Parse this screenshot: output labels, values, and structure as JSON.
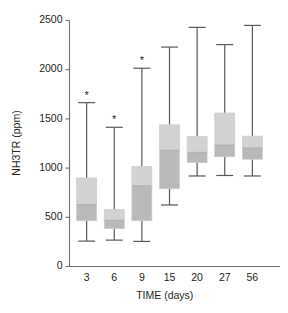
{
  "chart_data": {
    "type": "box",
    "title": "",
    "xlabel": "TIME (days)",
    "ylabel": "NH3TR (ppm)",
    "categories": [
      "3",
      "6",
      "9",
      "15",
      "20",
      "27",
      "56"
    ],
    "ylim": [
      0,
      2500
    ],
    "yticks": [
      0,
      500,
      1000,
      1500,
      2000,
      2500
    ],
    "ytick_labels": [
      "0",
      "500",
      "1000",
      "1500",
      "2000",
      "2500"
    ],
    "grid": false,
    "legend": "none",
    "colors": {
      "box_upper": "#d2d2d2",
      "box_lower": "#b9b9b9",
      "whisker": "#58595b",
      "axis": "#6d6e71",
      "text": "#231f20"
    },
    "boxes": [
      {
        "category": "3",
        "whisker_low": 258,
        "q1": 465,
        "median": 630,
        "q3": 900,
        "whisker_high": 1665,
        "outlier_marker": "*"
      },
      {
        "category": "6",
        "whisker_low": 268,
        "q1": 385,
        "median": 470,
        "q3": 580,
        "whisker_high": 1415,
        "outlier_marker": "*"
      },
      {
        "category": "9",
        "whisker_low": 255,
        "q1": 465,
        "median": 820,
        "q3": 1015,
        "whisker_high": 2015,
        "outlier_marker": "*"
      },
      {
        "category": "15",
        "whisker_low": 625,
        "q1": 790,
        "median": 1180,
        "q3": 1440,
        "whisker_high": 2230,
        "outlier_marker": ""
      },
      {
        "category": "20",
        "whisker_low": 920,
        "q1": 1055,
        "median": 1160,
        "q3": 1320,
        "whisker_high": 2430,
        "outlier_marker": ""
      },
      {
        "category": "27",
        "whisker_low": 925,
        "q1": 1115,
        "median": 1235,
        "q3": 1560,
        "whisker_high": 2255,
        "outlier_marker": ""
      },
      {
        "category": "56",
        "whisker_low": 920,
        "q1": 1090,
        "median": 1205,
        "q3": 1325,
        "whisker_high": 2450,
        "outlier_marker": ""
      }
    ]
  }
}
